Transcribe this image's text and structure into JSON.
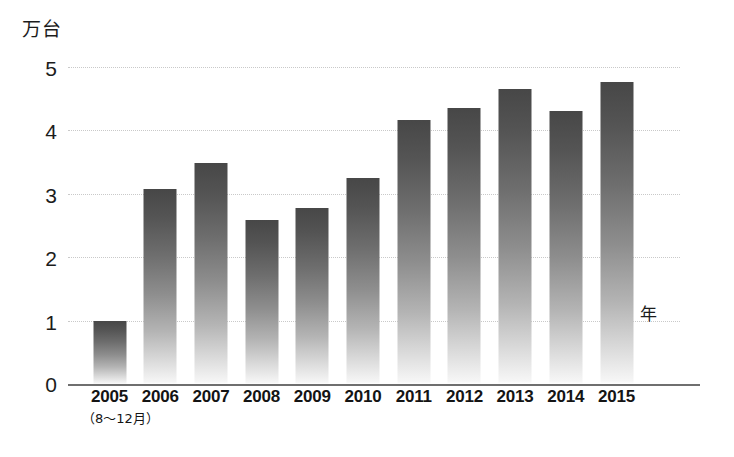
{
  "chart_data": {
    "type": "bar",
    "title": "",
    "subtitle": "",
    "xlabel": "年",
    "ylabel": "万台",
    "categories": [
      "2005",
      "2006",
      "2007",
      "2008",
      "2009",
      "2010",
      "2011",
      "2012",
      "2013",
      "2014",
      "2015"
    ],
    "category_sublabels": [
      "（8〜12月）",
      "",
      "",
      "",
      "",
      "",
      "",
      "",
      "",
      "",
      ""
    ],
    "values": [
      0.99,
      3.08,
      3.48,
      2.58,
      2.77,
      3.25,
      4.16,
      4.35,
      4.65,
      4.31,
      4.77
    ],
    "ylim": [
      0,
      5
    ],
    "ytick_labels": [
      "0",
      "1",
      "2",
      "3",
      "4",
      "5"
    ],
    "ytick_values": [
      0,
      1,
      2,
      3,
      4,
      5
    ],
    "grid": true,
    "grid_style": "dotted",
    "legend": false,
    "legend_position": "none",
    "annotations": []
  },
  "style": {
    "bar_color_top": "#474747",
    "bar_color_bottom": "#ffffff",
    "grid_color": "#c9c9c9",
    "axis_color": "#6f6f6f",
    "text_color": "#1c1c1c",
    "background": "#ffffff"
  }
}
